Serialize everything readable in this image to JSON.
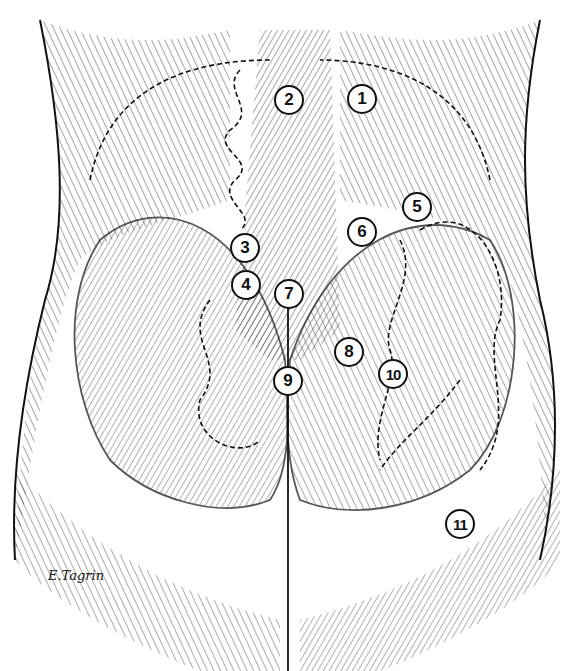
{
  "figure": {
    "type": "anatomical-illustration",
    "signature": "E.Tagrin",
    "markers": [
      {
        "label": "1",
        "x": 362,
        "y": 99
      },
      {
        "label": "2",
        "x": 289,
        "y": 100
      },
      {
        "label": "3",
        "x": 245,
        "y": 248
      },
      {
        "label": "4",
        "x": 246,
        "y": 285
      },
      {
        "label": "5",
        "x": 417,
        "y": 207
      },
      {
        "label": "6",
        "x": 362,
        "y": 232
      },
      {
        "label": "7",
        "x": 289,
        "y": 294
      },
      {
        "label": "8",
        "x": 349,
        "y": 352
      },
      {
        "label": "9",
        "x": 288,
        "y": 381
      },
      {
        "label": "10",
        "x": 393,
        "y": 374
      },
      {
        "label": "11",
        "x": 460,
        "y": 524
      }
    ],
    "colors": {
      "ink": "#111111",
      "paper": "#ffffff"
    }
  }
}
